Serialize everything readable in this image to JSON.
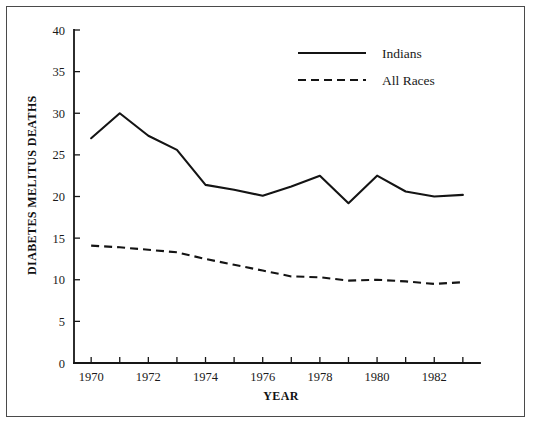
{
  "chart_data": {
    "type": "line",
    "title": "",
    "xlabel": "YEAR",
    "ylabel": "DIABETES MELITUS DEATHS",
    "xlim": [
      1969.4,
      1983.6
    ],
    "ylim": [
      0,
      40
    ],
    "grid": false,
    "legend_position": "top-right",
    "x": [
      1970,
      1971,
      1972,
      1973,
      1974,
      1975,
      1976,
      1977,
      1978,
      1979,
      1980,
      1981,
      1982,
      1983
    ],
    "xtick_values": [
      1970,
      1971,
      1972,
      1973,
      1974,
      1975,
      1976,
      1977,
      1978,
      1979,
      1980,
      1981,
      1982,
      1983
    ],
    "xtick_labels": [
      "1970",
      "",
      "1972",
      "",
      "1974",
      "",
      "1976",
      "",
      "1978",
      "",
      "1980",
      "",
      "1982",
      ""
    ],
    "ytick_values": [
      0,
      5,
      10,
      15,
      20,
      25,
      30,
      35,
      40
    ],
    "ytick_labels": [
      "0",
      "5",
      "10",
      "15",
      "20",
      "25",
      "30",
      "35",
      "40"
    ],
    "series": [
      {
        "name": "Indians",
        "style": "solid",
        "color": "#141414",
        "values": [
          27.0,
          30.0,
          27.3,
          25.6,
          21.4,
          20.8,
          20.1,
          21.2,
          22.5,
          19.2,
          22.5,
          20.6,
          20.0,
          20.2
        ]
      },
      {
        "name": "All Races",
        "style": "dashed",
        "color": "#141414",
        "values": [
          14.1,
          13.9,
          13.6,
          13.3,
          12.5,
          11.8,
          11.1,
          10.4,
          10.3,
          9.9,
          10.0,
          9.8,
          9.5,
          9.7
        ]
      }
    ]
  },
  "legend": {
    "entries": [
      {
        "label": "Indians",
        "style": "solid"
      },
      {
        "label": "All Races",
        "style": "dashed"
      }
    ]
  },
  "axes": {
    "y_title": "DIABETES MELITUS DEATHS",
    "x_title": "YEAR"
  }
}
